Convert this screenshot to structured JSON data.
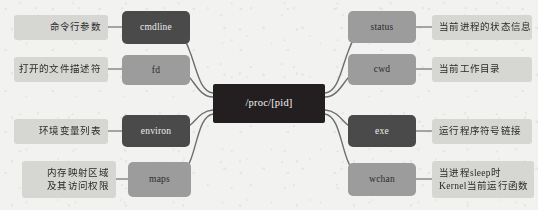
{
  "diagram": {
    "title": "/proc/[pid]",
    "type": "mind-map",
    "center": {
      "label": "/proc/[pid]",
      "color": "#231f20"
    },
    "colors": {
      "background": "#f2f2f0",
      "center_node": "#231f20",
      "node_light": "#9c9c9c",
      "node_dark": "#4a4a4a",
      "leaf_label": "#d6d6d2",
      "edge": "#6e6e6e"
    },
    "left_branches": [
      {
        "node": "cmdline",
        "node_style": "dark",
        "description": "命令行参数"
      },
      {
        "node": "fd",
        "node_style": "light",
        "description": "打开的文件描述符"
      },
      {
        "node": "environ",
        "node_style": "dark",
        "description": "环境变量列表"
      },
      {
        "node": "maps",
        "node_style": "light",
        "description": "内存映射区域\n及其访问权限"
      }
    ],
    "right_branches": [
      {
        "node": "status",
        "node_style": "light",
        "description": "当前进程的状态信息"
      },
      {
        "node": "cwd",
        "node_style": "light",
        "description": "当前工作目录"
      },
      {
        "node": "exe",
        "node_style": "dark",
        "description": "运行程序符号链接"
      },
      {
        "node": "wchan",
        "node_style": "light",
        "description": "当进程sleep时\nKernel当前运行函数"
      }
    ]
  }
}
